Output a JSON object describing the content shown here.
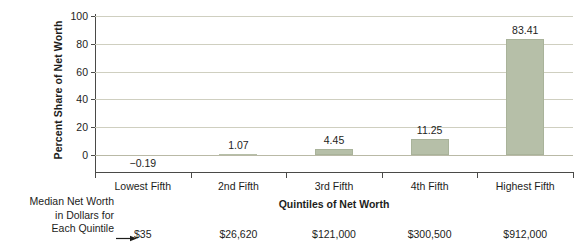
{
  "chart_data": {
    "type": "bar",
    "title": "",
    "xlabel": "Quintiles of Net Worth",
    "ylabel": "Percent Share of Net Worth",
    "categories": [
      "Lowest Fifth",
      "2nd Fifth",
      "3rd Fifth",
      "4th Fifth",
      "Highest Fifth"
    ],
    "values": [
      -0.19,
      1.07,
      4.45,
      11.25,
      83.41
    ],
    "value_labels": [
      "−0.19",
      "1.07",
      "4.45",
      "11.25",
      "83.41"
    ],
    "ylim": [
      0,
      100
    ],
    "yticks": [
      0,
      20,
      40,
      60,
      80,
      100
    ],
    "ytick_labels": [
      "0",
      "20",
      "40",
      "60",
      "80",
      "100"
    ],
    "grid": true,
    "legend": "none",
    "bar_color": "#b6bfa8",
    "gridline_color": "#cfcfc0",
    "axis_color": "#4a4a48",
    "secondary_axis": {
      "label_lines": [
        "Median Net Worth",
        "in Dollars for",
        "Each Quintile"
      ],
      "values": [
        "$35",
        "$26,620",
        "$121,000",
        "$300,500",
        "$912,000"
      ]
    }
  }
}
